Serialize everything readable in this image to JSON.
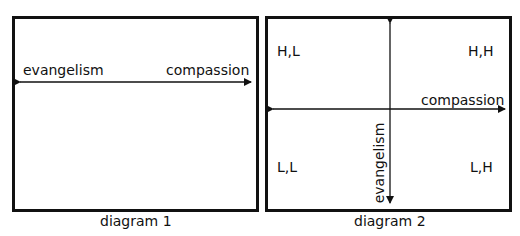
{
  "diagram1": {
    "caption": "diagram 1",
    "axis": {
      "left_label": "evangelism",
      "right_label": "compassion",
      "orientation": "horizontal",
      "bidirectional": true
    }
  },
  "diagram2": {
    "caption": "diagram 2",
    "x_axis": {
      "label": "compassion",
      "bidirectional": true
    },
    "y_axis": {
      "label": "evangelism",
      "bidirectional": true
    },
    "quadrants": {
      "top_left": "H,L",
      "top_right": "H,H",
      "bottom_left": "L,L",
      "bottom_right": "L,H"
    }
  },
  "colors": {
    "line": "#111111",
    "background": "#ffffff"
  }
}
